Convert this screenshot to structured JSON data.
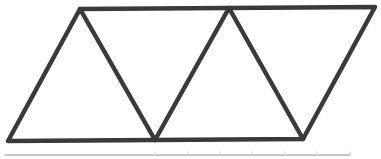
{
  "diagram": {
    "stroke_color": "#3a3a3a",
    "stroke_width": 4.5,
    "background": "#ffffff",
    "vertices": {
      "top": [
        [
          80,
          9
        ],
        [
          229,
          8
        ],
        [
          375,
          7
        ]
      ],
      "bottom": [
        [
          8,
          141
        ],
        [
          155,
          140
        ],
        [
          303,
          139
        ]
      ]
    },
    "triangles": 4,
    "bottom_strip": {
      "color": "#b5b5b5",
      "y": 155,
      "x_start": 5,
      "x_end": 350,
      "tick_x": [
        155,
        188,
        220,
        252,
        285,
        317,
        350
      ]
    }
  }
}
